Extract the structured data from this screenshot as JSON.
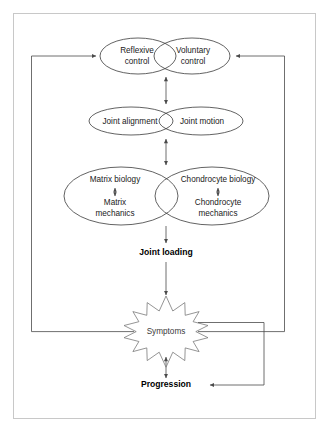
{
  "figure": {
    "frame_color": "#c8c8c8",
    "background": "#ffffff"
  },
  "nodes": {
    "reflexive_control": {
      "line1": "Reflexive",
      "line2": "control"
    },
    "voluntary_control": {
      "line1": "Voluntary",
      "line2": "control"
    },
    "joint_alignment": {
      "label": "Joint alignment"
    },
    "joint_motion": {
      "label": "Joint motion"
    },
    "matrix_biology": {
      "label": "Matrix biology"
    },
    "matrix_mechanics": {
      "line1": "Matrix",
      "line2": "mechanics"
    },
    "chondrocyte_biology": {
      "label": "Chondrocyte biology"
    },
    "chondrocyte_mechanics": {
      "line1": "Chondrocyte",
      "line2": "mechanics"
    },
    "joint_loading": {
      "label": "Joint loading"
    },
    "symptoms": {
      "label": "Symptoms"
    },
    "progression": {
      "label": "Progression"
    }
  },
  "colors": {
    "ellipse_stroke": "#3b3b3b",
    "star_stroke": "#7a7a7a",
    "connector_stroke": "#4a4a4a",
    "text": "#1a1a1a"
  },
  "connectors": [
    {
      "name": "control-to-alignment",
      "type": "double-arrow",
      "orientation": "vertical"
    },
    {
      "name": "alignment-to-biology",
      "type": "double-arrow",
      "orientation": "vertical"
    },
    {
      "name": "matrix-biology-to-matrix-mechanics",
      "type": "double-arrow",
      "orientation": "vertical"
    },
    {
      "name": "chondrocyte-biology-to-chondrocyte-mechanics",
      "type": "double-arrow",
      "orientation": "vertical"
    },
    {
      "name": "biology-to-joint-loading",
      "type": "arrow",
      "orientation": "down"
    },
    {
      "name": "joint-loading-to-symptoms",
      "type": "arrow",
      "orientation": "down"
    },
    {
      "name": "symptoms-to-progression",
      "type": "double-arrow",
      "orientation": "vertical"
    },
    {
      "name": "symptoms-feedback-left-to-reflexive-control",
      "type": "arrow",
      "orientation": "routed-left-up"
    },
    {
      "name": "symptoms-feedback-right-to-voluntary-control",
      "type": "arrow",
      "orientation": "routed-right-up"
    },
    {
      "name": "symptoms-feedback-right-to-progression",
      "type": "arrow",
      "orientation": "routed-right-down"
    }
  ]
}
